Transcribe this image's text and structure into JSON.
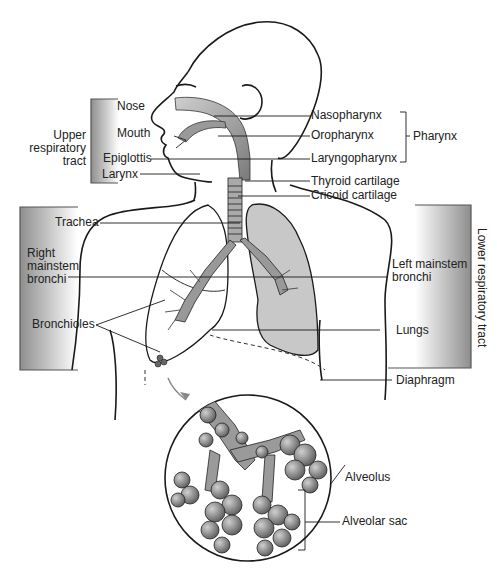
{
  "diagram": {
    "groups": {
      "upper_tract": "Upper respiratory tract",
      "upper_tract_lines": [
        "Upper",
        "respiratory",
        "tract"
      ],
      "lower_tract": "Lower respiratory tract",
      "pharynx": "Pharynx"
    },
    "labels": {
      "nose": "Nose",
      "mouth": "Mouth",
      "epiglottis": "Epiglottis",
      "larynx": "Larynx",
      "nasopharynx": "Nasopharynx",
      "oropharynx": "Oropharynx",
      "laryngopharynx": "Laryngopharynx",
      "thyroid_cartilage": "Thyroid cartilage",
      "cricoid_cartilage": "Cricoid cartilage",
      "trachea": "Trachea",
      "right_mainstem_lines": [
        "Right",
        "mainstem",
        "bronchi"
      ],
      "left_mainstem_lines": [
        "Left mainstem",
        "bronchi"
      ],
      "bronchioles": "Bronchioles",
      "lungs": "Lungs",
      "diaphragm": "Diaphragm",
      "alveolus": "Alveolus",
      "alveolar_sac": "Alveolar sac"
    },
    "colors": {
      "airway_gray": "#8a8a8a",
      "lung_gray": "#c8c8c8",
      "panel_dark": "#9a9a9a",
      "line": "#1a1a1a"
    }
  }
}
